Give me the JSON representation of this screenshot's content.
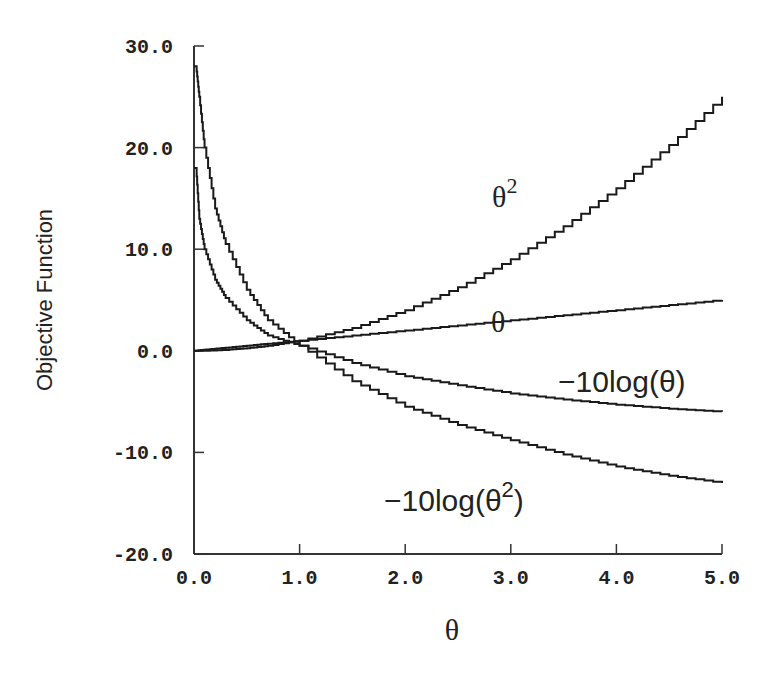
{
  "chart_data": {
    "type": "line",
    "title": "",
    "xlabel": "θ",
    "ylabel": "Objective Function",
    "xlim": [
      0.0,
      5.0
    ],
    "ylim": [
      -20.0,
      30.0
    ],
    "grid": false,
    "legend": "inline labels",
    "x_ticks": [
      "0.0",
      "1.0",
      "2.0",
      "3.0",
      "4.0",
      "5.0"
    ],
    "y_ticks": [
      "30.0",
      "20.0",
      "10.0",
      "0.0",
      "-10.0",
      "-20.0"
    ],
    "x": [
      0.02,
      0.05,
      0.1,
      0.2,
      0.3,
      0.5,
      0.7,
      1.0,
      1.5,
      2.0,
      2.5,
      3.0,
      3.5,
      4.0,
      4.5,
      5.0
    ],
    "series": [
      {
        "name": "θ^2",
        "label": "θ2",
        "values": [
          0.0,
          0.0,
          0.0,
          0.04,
          0.09,
          0.25,
          0.49,
          1.0,
          2.25,
          4.0,
          6.25,
          9.0,
          12.25,
          16.0,
          20.25,
          25.0
        ]
      },
      {
        "name": "θ",
        "label": "θ",
        "values": [
          0.0,
          0.05,
          0.1,
          0.2,
          0.3,
          0.5,
          0.7,
          1.0,
          1.5,
          2.0,
          2.5,
          3.0,
          3.5,
          4.0,
          4.5,
          5.0
        ]
      },
      {
        "name": "-10log(θ)",
        "label": "−10log(θ)",
        "values": [
          18.0,
          13.0,
          10.0,
          7.0,
          5.2,
          3.0,
          1.5,
          0.5,
          -1.2,
          -2.5,
          -3.4,
          -4.2,
          -4.8,
          -5.3,
          -5.7,
          -6.0
        ]
      },
      {
        "name": "-10log(θ^2)",
        "label": "−10log(θ2)",
        "values": [
          28.0,
          25.0,
          20.0,
          14.0,
          10.5,
          6.0,
          3.0,
          0.5,
          -3.0,
          -5.5,
          -7.3,
          -8.8,
          -10.2,
          -11.4,
          -12.3,
          -13.0
        ]
      }
    ],
    "labels": {
      "theta_sq": {
        "base": "θ",
        "sup": "2"
      },
      "theta": "θ",
      "neg_log_theta": "−10log(θ)",
      "neg_log_theta_sq": {
        "prefix": "−10log(θ",
        "sup": "2",
        "suffix": ")"
      }
    }
  }
}
